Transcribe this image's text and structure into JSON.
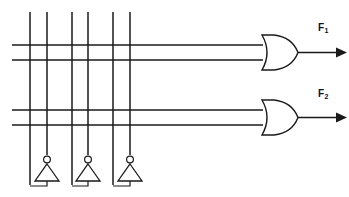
{
  "diagram": {
    "type": "logic-circuit",
    "ink_color": "#1a1a1a",
    "background_color": "#ffffff",
    "outputs": [
      {
        "id": "f1",
        "label": "F",
        "subscript": "1"
      },
      {
        "id": "f2",
        "label": "F",
        "subscript": "2"
      }
    ],
    "gates": [
      {
        "id": "or-gate-1",
        "kind": "or",
        "inputs": 2,
        "output": "F1"
      },
      {
        "id": "or-gate-2",
        "kind": "or",
        "inputs": 2,
        "output": "F2"
      }
    ],
    "inverters": [
      {
        "id": "inverter-1",
        "kind": "not",
        "bubble": true,
        "orientation": "apex-up"
      },
      {
        "id": "inverter-2",
        "kind": "not",
        "bubble": true,
        "orientation": "apex-up"
      },
      {
        "id": "inverter-3",
        "kind": "not",
        "bubble": true,
        "orientation": "apex-up"
      }
    ],
    "vertical_lines_count": 6,
    "horizontal_lines_count": 4
  },
  "geometry": {
    "canvas": {
      "width": 349,
      "height": 197
    },
    "vertical_lines": [
      {
        "x": 30,
        "y1": 12,
        "y2": 185
      },
      {
        "x": 47,
        "y1": 12,
        "y2": 158
      },
      {
        "x": 72,
        "y1": 12,
        "y2": 185
      },
      {
        "x": 88,
        "y1": 12,
        "y2": 158
      },
      {
        "x": 113,
        "y1": 12,
        "y2": 185
      },
      {
        "x": 130,
        "y1": 12,
        "y2": 158
      }
    ],
    "horizontal_lines": [
      {
        "y": 45,
        "x1": 12,
        "x2": 262
      },
      {
        "y": 60,
        "x1": 12,
        "x2": 262
      },
      {
        "y": 110,
        "x1": 12,
        "x2": 262
      },
      {
        "y": 125,
        "x1": 12,
        "x2": 262
      }
    ],
    "or_gates": [
      {
        "x": 262,
        "cy": 52.5,
        "w": 36,
        "h": 34
      },
      {
        "x": 262,
        "cy": 117.5,
        "w": 36,
        "h": 34
      }
    ],
    "inverters": [
      {
        "cx": 47,
        "bubble_cy": 160,
        "apex_y": 165,
        "base_y": 181,
        "half_w": 12,
        "out_x": 30
      },
      {
        "cx": 88,
        "bubble_cy": 160,
        "apex_y": 165,
        "base_y": 181,
        "half_w": 12,
        "out_x": 72
      },
      {
        "cx": 130,
        "bubble_cy": 160,
        "apex_y": 165,
        "base_y": 181,
        "half_w": 12,
        "out_x": 113
      }
    ],
    "output_wires": [
      {
        "x1": 298,
        "x2": 342,
        "y": 52.5
      },
      {
        "x1": 298,
        "x2": 342,
        "y": 117.5
      }
    ]
  }
}
